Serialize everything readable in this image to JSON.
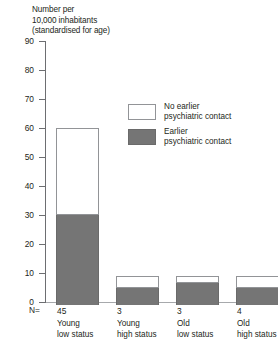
{
  "chart_data": {
    "type": "bar",
    "title": "Number per\n10,000 inhabitants\n(standardised for age)",
    "title_lines": [
      "Number per",
      "10,000 inhabitants",
      "(standardised for age)"
    ],
    "xlabel": "",
    "ylabel": "Number per 10,000 inhabitants (standardised for age)",
    "ylim": [
      0,
      90
    ],
    "yticks": [
      0,
      10,
      20,
      30,
      40,
      50,
      60,
      70,
      80,
      90
    ],
    "ytick_labels": [
      "0",
      "10",
      "20",
      "30",
      "40",
      "50",
      "60",
      "70",
      "80",
      "90"
    ],
    "grid": false,
    "stacked": true,
    "legend_position": "inside-upper-center",
    "categories": [
      "Young\nlow status",
      "Young\nhigh status",
      "Old\nlow status",
      "Old\nhigh status"
    ],
    "category_lines": [
      [
        "Young",
        "low status"
      ],
      [
        "Young",
        "high status"
      ],
      [
        "Old",
        "low status"
      ],
      [
        "Old",
        "high status"
      ]
    ],
    "n_prefix": "N=",
    "n_values": [
      "45",
      "3",
      "3",
      "4"
    ],
    "series": [
      {
        "name": "Earlier psychiatric contact",
        "color": "#757575",
        "values": [
          31,
          6,
          7.5,
          6
        ]
      },
      {
        "name": "No earlier psychiatric contact",
        "color": "#ffffff",
        "values": [
          30,
          4,
          2.5,
          4
        ]
      }
    ],
    "totals": [
      61,
      10,
      10,
      10
    ],
    "legend": [
      {
        "swatch": "empty",
        "lines": [
          "No earlier",
          "psychiatric contact"
        ],
        "label": "No earlier psychiatric contact"
      },
      {
        "swatch": "filled",
        "lines": [
          "Earlier",
          "psychiatric contact"
        ],
        "label": "Earlier psychiatric contact"
      }
    ]
  },
  "colors": {
    "earlier_contact": "#757575",
    "no_earlier_contact": "#ffffff",
    "axis": "#6d6e71",
    "text": "#231f20"
  }
}
